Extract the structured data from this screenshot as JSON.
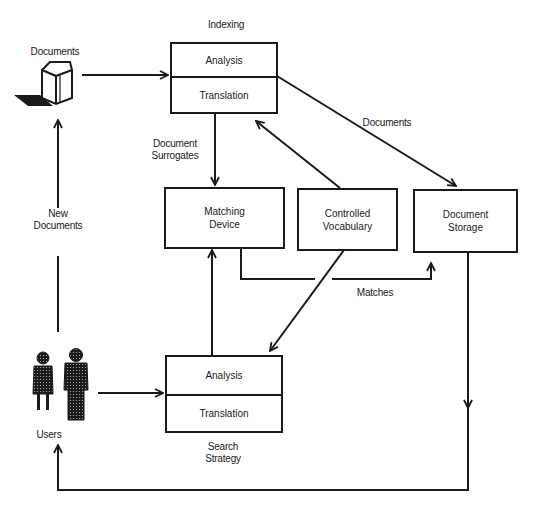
{
  "diagram": {
    "title_indexing": "Indexing",
    "indexing_box": {
      "top": "Analysis",
      "bottom": "Translation"
    },
    "search_box": {
      "top": "Analysis",
      "bottom": "Translation"
    },
    "search_caption_line1": "Search",
    "search_caption_line2": "Strategy",
    "matching_line1": "Matching",
    "matching_line2": "Device",
    "vocab_line1": "Controlled",
    "vocab_line2": "Vocabulary",
    "storage_line1": "Document",
    "storage_line2": "Storage",
    "documents_source_label": "Documents",
    "documents_edge_label": "Documents",
    "surrogates_line1": "Document",
    "surrogates_line2": "Surrogates",
    "matches_label": "Matches",
    "new_docs_line1": "New",
    "new_docs_line2": "Documents",
    "users_label": "Users",
    "icons": {
      "documents": "document-stack-icon",
      "users": "users-icon"
    },
    "colors": {
      "ink": "#1a1a1a",
      "background": "#ffffff"
    }
  }
}
